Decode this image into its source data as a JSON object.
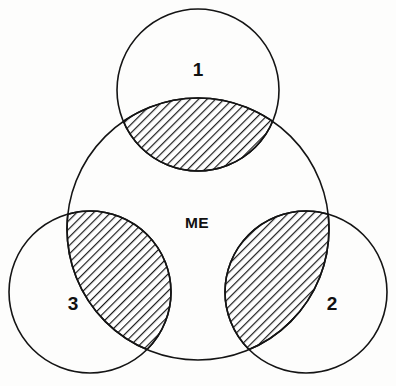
{
  "diagram": {
    "kind": "venn-diagram",
    "background_color": "#fdfdfc",
    "stroke_color": "#141414",
    "hatch_color": "#1a1a1a",
    "center_label": "ME",
    "circles": [
      {
        "id": "me",
        "label": "ME",
        "cx": 198,
        "cy": 229,
        "r": 131,
        "role": "central-self-circle"
      },
      {
        "id": "one",
        "label": "1",
        "cx": 198,
        "cy": 90,
        "r": 81,
        "role": "outer-circle-top"
      },
      {
        "id": "two",
        "label": "2",
        "cx": 306,
        "cy": 292,
        "r": 81,
        "role": "outer-circle-bottom-right"
      },
      {
        "id": "three",
        "label": "3",
        "cx": 90,
        "cy": 292,
        "r": 81,
        "role": "outer-circle-bottom-left"
      }
    ],
    "labels": [
      {
        "id": "label-1",
        "text": "1",
        "x": 198,
        "y": 76
      },
      {
        "id": "label-2",
        "text": "2",
        "x": 332,
        "y": 310
      },
      {
        "id": "label-3",
        "text": "3",
        "x": 73,
        "y": 310
      },
      {
        "id": "label-me",
        "text": "ME",
        "x": 197,
        "y": 228
      }
    ],
    "shaded_regions": [
      {
        "id": "overlap-me-1",
        "between": [
          "ME",
          "1"
        ],
        "pattern": "diagonal-hatch"
      },
      {
        "id": "overlap-me-2",
        "between": [
          "ME",
          "2"
        ],
        "pattern": "diagonal-hatch"
      },
      {
        "id": "overlap-me-3",
        "between": [
          "ME",
          "3"
        ],
        "pattern": "diagonal-hatch"
      }
    ]
  }
}
